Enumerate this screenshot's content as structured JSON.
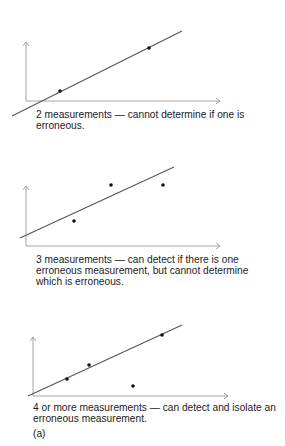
{
  "figure": {
    "label": "(a)",
    "colors": {
      "axis": "#9a9a9a",
      "fit_line": "#555555",
      "point": "#111111",
      "text": "#222222"
    },
    "panels": [
      {
        "id": "two-measurements",
        "caption_lines": [
          "2 measurements — cannot determine if one is",
          "erroneous."
        ],
        "axes": {
          "origin": [
            26,
            101
          ],
          "y_top": 42,
          "x_right": 220
        },
        "fit_line": {
          "from": [
            12,
            116
          ],
          "to": [
            182,
            31
          ]
        },
        "points": [
          [
            60,
            91
          ],
          [
            149,
            48
          ]
        ]
      },
      {
        "id": "three-measurements",
        "caption_lines": [
          "3 measurements — can detect if there is one",
          "erroneous measurement, but cannot determine",
          "which is erroneous."
        ],
        "axes": {
          "origin": [
            26,
            246
          ],
          "y_top": 186,
          "x_right": 220
        },
        "fit_line": {
          "from": [
            20,
            238
          ],
          "to": [
            174,
            167
          ]
        },
        "points": [
          [
            74,
            221
          ],
          [
            111,
            185
          ],
          [
            163,
            185
          ]
        ]
      },
      {
        "id": "four-or-more-measurements",
        "caption_lines": [
          "4 or more measurements — can detect and isolate an",
          "erroneous measurement."
        ],
        "axes": {
          "origin": [
            33,
            396
          ],
          "y_top": 337,
          "x_right": 228
        },
        "fit_line": {
          "from": [
            28,
            396
          ],
          "to": [
            182,
            325
          ]
        },
        "points": [
          [
            67,
            379
          ],
          [
            89,
            365
          ],
          [
            162,
            335
          ],
          [
            133,
            386
          ]
        ]
      }
    ]
  }
}
